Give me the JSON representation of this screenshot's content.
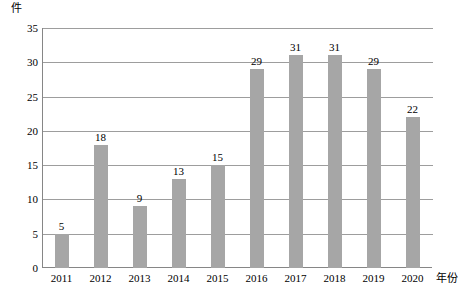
{
  "chart_data": {
    "type": "bar",
    "title": "",
    "subtitle": "",
    "xlabel": "年份",
    "ylabel": "件",
    "categories": [
      "2011",
      "2012",
      "2013",
      "2014",
      "2015",
      "2016",
      "2017",
      "2018",
      "2019",
      "2020"
    ],
    "values": [
      5,
      18,
      9,
      13,
      15,
      29,
      31,
      31,
      29,
      22
    ],
    "data_labels": [
      "5",
      "18",
      "9",
      "13",
      "15",
      "29",
      "31",
      "31",
      "29",
      "22"
    ],
    "ylim": [
      0,
      35
    ],
    "ytick_values": [
      0,
      5,
      10,
      15,
      20,
      25,
      30,
      35
    ],
    "ytick_labels": [
      "0",
      "5",
      "10",
      "15",
      "20",
      "25",
      "30",
      "35"
    ],
    "grid": "horizontal",
    "legend": "none",
    "bar_color": "#a6a6a6",
    "axis_color": "#868686",
    "gridline_color": "#9d9d9d",
    "text_color": "#000000",
    "annotations": []
  }
}
